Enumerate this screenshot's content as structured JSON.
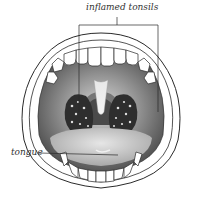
{
  "diagram": {
    "labels": {
      "tonsils": "inflamed tonsils",
      "tongue": "tongue"
    },
    "colors": {
      "outline": "#2a2a2a",
      "throat_dark": "#3a3a3a",
      "throat_mid": "#8a8a8a",
      "palate": "#b8b8b8",
      "tongue": "#cfcfcf",
      "teeth": "#ffffff",
      "tonsil": "#2e2e2e",
      "spots": "#e0e0e0"
    }
  }
}
